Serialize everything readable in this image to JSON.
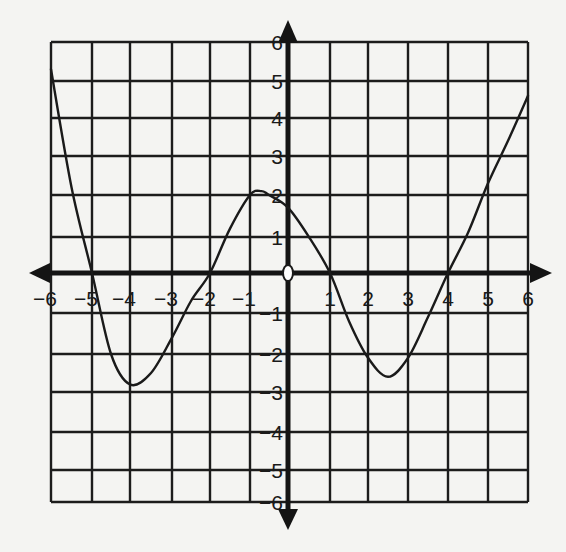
{
  "chart_data": {
    "type": "line",
    "title": "",
    "xlabel": "",
    "ylabel": "",
    "xlim": [
      -6,
      6
    ],
    "ylim": [
      -6,
      6
    ],
    "grid": true,
    "origin_marker": "open-circle",
    "x_tick_labels": [
      "-6",
      "-5",
      "-4",
      "-3",
      "-2",
      "-1",
      "1",
      "2",
      "3",
      "4",
      "5",
      "6"
    ],
    "y_tick_labels": [
      "6",
      "5",
      "4",
      "3",
      "2",
      "1",
      "-1",
      "-2",
      "-3",
      "-4",
      "-5",
      "-6"
    ],
    "series": [
      {
        "name": "f(x)",
        "x": [
          -6,
          -5.5,
          -5,
          -4.5,
          -4,
          -3.5,
          -3,
          -2.5,
          -2,
          -1.5,
          -1,
          -0.7,
          -0.5,
          0,
          0.5,
          1,
          1.5,
          2,
          2.5,
          3,
          3.5,
          4,
          4.5,
          5,
          5.5,
          6
        ],
        "y": [
          5.3,
          2.2,
          0,
          -2.0,
          -2.8,
          -2.5,
          -1.6,
          -0.7,
          0,
          1.2,
          2.0,
          2.1,
          2.0,
          1.7,
          1.0,
          0,
          -1.2,
          -2.1,
          -2.6,
          -2.1,
          -1.1,
          0,
          1.1,
          2.3,
          3.4,
          4.6
        ]
      }
    ],
    "zeros": [
      -5,
      -2,
      1,
      4
    ],
    "local_max": {
      "x": -0.7,
      "y": 2.1
    },
    "local_min": [
      {
        "x": -4,
        "y": -2.8
      },
      {
        "x": 2.5,
        "y": -2.6
      }
    ]
  }
}
